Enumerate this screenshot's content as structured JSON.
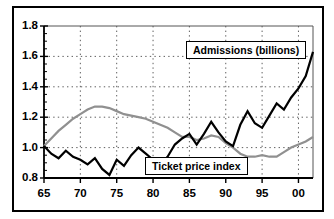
{
  "chart_data": {
    "type": "line",
    "title": "",
    "subtitle": "",
    "xlabel": "",
    "ylabel": "",
    "xlim": [
      65,
      102
    ],
    "ylim": [
      0.8,
      1.8
    ],
    "grid": true,
    "grid_style": "dotted",
    "legend_position": "inline-callout",
    "x_tick_labels": [
      "65",
      "70",
      "75",
      "80",
      "85",
      "90",
      "95",
      "00"
    ],
    "x_tick_values": [
      65,
      70,
      75,
      80,
      85,
      90,
      95,
      100
    ],
    "y_tick_labels": [
      "0.8",
      "1.0",
      "1.2",
      "1.4",
      "1.6",
      "1.8"
    ],
    "y_tick_values": [
      0.8,
      1.0,
      1.2,
      1.4,
      1.6,
      1.8
    ],
    "x": [
      65,
      66,
      67,
      68,
      69,
      70,
      71,
      72,
      73,
      74,
      75,
      76,
      77,
      78,
      79,
      80,
      81,
      82,
      83,
      84,
      85,
      86,
      87,
      88,
      89,
      90,
      91,
      92,
      93,
      94,
      95,
      96,
      97,
      98,
      99,
      100,
      101,
      102
    ],
    "series": [
      {
        "name": "Admissions (billions)",
        "color": "#000000",
        "linewidth": 2.2,
        "values": [
          1.01,
          0.96,
          0.93,
          0.98,
          0.94,
          0.92,
          0.89,
          0.93,
          0.86,
          0.82,
          0.92,
          0.88,
          0.95,
          1.0,
          0.96,
          0.92,
          0.88,
          0.94,
          1.02,
          1.06,
          1.09,
          1.02,
          1.09,
          1.17,
          1.1,
          1.04,
          1.01,
          1.15,
          1.24,
          1.16,
          1.13,
          1.21,
          1.29,
          1.25,
          1.33,
          1.39,
          1.47,
          1.63
        ]
      },
      {
        "name": "Ticket price index",
        "color": "#909090",
        "linewidth": 2.2,
        "values": [
          1.01,
          1.06,
          1.11,
          1.15,
          1.19,
          1.22,
          1.25,
          1.27,
          1.27,
          1.26,
          1.24,
          1.22,
          1.21,
          1.2,
          1.19,
          1.17,
          1.15,
          1.13,
          1.1,
          1.07,
          1.07,
          1.05,
          1.06,
          1.08,
          1.07,
          1.03,
          1.0,
          0.96,
          0.94,
          0.94,
          0.95,
          0.94,
          0.94,
          0.97,
          1.0,
          1.02,
          1.04,
          1.07
        ]
      }
    ],
    "annotations": [
      {
        "name": "admissions-callout",
        "text": "Admissions (billions)"
      },
      {
        "name": "ticket-price-callout",
        "text": "Ticket price index"
      }
    ]
  },
  "callouts": {
    "admissions": "Admissions (billions)",
    "ticket_price": "Ticket price index"
  }
}
